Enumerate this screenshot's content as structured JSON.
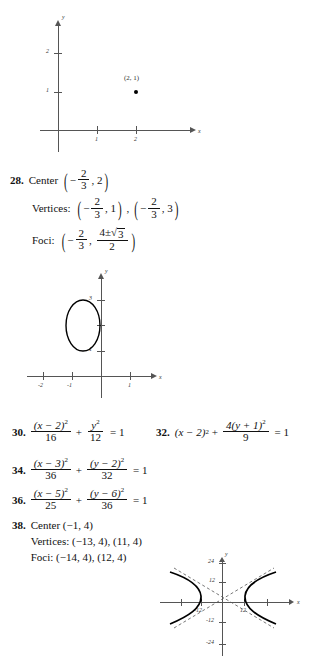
{
  "graph_point": {
    "name": "coordinate-plane-point-2-1",
    "x_axis_label": "x",
    "y_axis_label": "y",
    "x_ticks": [
      "1",
      "2"
    ],
    "y_ticks": [
      "1",
      "2"
    ],
    "point_label": "(2, 1)",
    "point": [
      2,
      1
    ]
  },
  "problem_28": {
    "number": "28.",
    "center_label": "Center",
    "center_x_num": "2",
    "center_x_den": "3",
    "center_y": "2",
    "vertices_label": "Vertices:",
    "v1_x_num": "2",
    "v1_x_den": "3",
    "v1_y": "1",
    "v2_x_num": "2",
    "v2_x_den": "3",
    "v2_y": "3",
    "foci_label": "Foci:",
    "f_x_num": "2",
    "f_x_den": "3",
    "f_y_num_a": "4",
    "f_y_num_pm": "±",
    "f_y_num_rad": "3",
    "f_y_den": "2"
  },
  "graph_ellipse": {
    "name": "ellipse-graph-problem-28",
    "x_axis_label": "x",
    "y_axis_label": "y",
    "x_ticks": [
      "-2",
      "-1",
      "1"
    ],
    "y_ticks": [
      "1",
      "3"
    ],
    "center": [
      -0.667,
      2
    ],
    "semi_x": 0.577,
    "semi_y": 1
  },
  "problem_30": {
    "number": "30.",
    "n1": "(x − 2)",
    "n1sup": "2",
    "d1": "16",
    "n2": "y",
    "n2sup": "2",
    "d2": "12",
    "plus": "+",
    "eq": "= 1"
  },
  "problem_32": {
    "number": "32.",
    "lead": "(x − 2)",
    "leadsup": "2",
    "plus": "+",
    "n1": "4(y + 1)",
    "n1sup": "2",
    "d1": "9",
    "eq": "= 1"
  },
  "problem_34": {
    "number": "34.",
    "n1": "(x − 3)",
    "n1sup": "2",
    "d1": "36",
    "n2": "(y − 2)",
    "n2sup": "2",
    "d2": "32",
    "plus": "+",
    "eq": "= 1"
  },
  "problem_36": {
    "number": "36.",
    "n1": "(x − 5)",
    "n1sup": "2",
    "d1": "25",
    "n2": "(y − 6)",
    "n2sup": "2",
    "d2": "36",
    "plus": "+",
    "eq": "= 1"
  },
  "problem_38": {
    "number": "38.",
    "center_line": "Center (−1, 4)",
    "vertices_line": "Vertices: (−13, 4), (11, 4)",
    "foci_line": "Foci: (−14, 4), (12, 4)"
  },
  "graph_hyperbola": {
    "name": "hyperbola-graph-problem-38",
    "x_axis_label": "x",
    "y_axis_label": "y",
    "x_ticks": [
      "-12",
      "12"
    ],
    "y_ticks": [
      "24",
      "12",
      "-12",
      "-24"
    ],
    "center": [
      -1,
      4
    ],
    "a": 12,
    "asymptotes": "dashed"
  },
  "colors": {
    "ink": "#111111",
    "axis": "#555555",
    "curve": "#000000"
  }
}
